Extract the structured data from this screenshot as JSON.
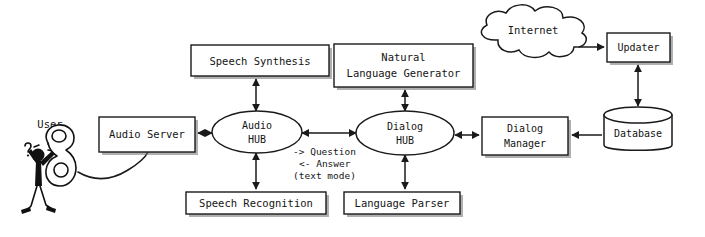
{
  "diagram": {
    "background_color": "#ffffff",
    "ink_color": "#1a1a1a",
    "nodes": {
      "user": {
        "label": "User",
        "shape": "cartoon-person-with-telephone"
      },
      "audio_server": {
        "label": "Audio Server",
        "shape": "rectangle"
      },
      "audio_hub": {
        "label_line1": "Audio",
        "label_line2": "HUB",
        "shape": "ellipse"
      },
      "speech_synthesis": {
        "label": "Speech Synthesis",
        "shape": "rectangle"
      },
      "speech_recognition": {
        "label": "Speech Recognition",
        "shape": "rectangle"
      },
      "dialog_hub": {
        "label_line1": "Dialog",
        "label_line2": "HUB",
        "shape": "ellipse"
      },
      "natural_language_generator": {
        "label_line1": "Natural",
        "label_line2": "Language Generator",
        "shape": "rectangle"
      },
      "language_parser": {
        "label": "Language Parser",
        "shape": "rectangle"
      },
      "dialog_manager": {
        "label_line1": "Dialog",
        "label_line2": "Manager",
        "shape": "rectangle"
      },
      "database": {
        "label": "Database",
        "shape": "cylinder"
      },
      "updater": {
        "label": "Updater",
        "shape": "rectangle"
      },
      "internet": {
        "label": "Internet",
        "shape": "cloud"
      }
    },
    "annotations": {
      "question": "-> Question",
      "answer": "<- Answer",
      "text_mode": "(text mode)"
    },
    "edges": [
      {
        "from": "audio_hub",
        "to": "speech_synthesis",
        "arrow": "both"
      },
      {
        "from": "audio_hub",
        "to": "speech_recognition",
        "arrow": "both"
      },
      {
        "from": "audio_server",
        "to": "audio_hub",
        "arrow": "both"
      },
      {
        "from": "audio_hub",
        "to": "dialog_hub",
        "arrow": "both"
      },
      {
        "from": "dialog_hub",
        "to": "natural_language_generator",
        "arrow": "both"
      },
      {
        "from": "dialog_hub",
        "to": "language_parser",
        "arrow": "both"
      },
      {
        "from": "dialog_hub",
        "to": "dialog_manager",
        "arrow": "both"
      },
      {
        "from": "database",
        "to": "dialog_manager",
        "arrow": "single"
      },
      {
        "from": "database",
        "to": "updater",
        "arrow": "both"
      },
      {
        "from": "internet",
        "to": "updater",
        "arrow": "single"
      },
      {
        "from": "user",
        "to": "audio_server",
        "arrow": "cable"
      }
    ]
  }
}
